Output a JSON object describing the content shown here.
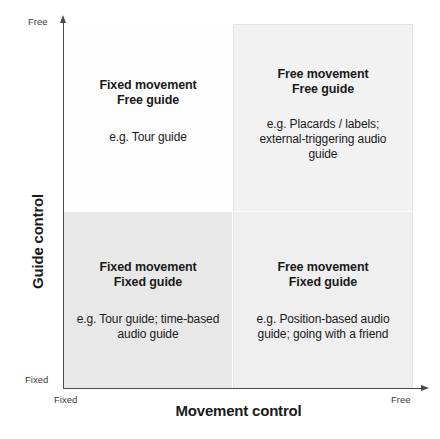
{
  "chart_data": {
    "type": "table",
    "title": "",
    "xlabel": "Movement control",
    "ylabel": "Guide control",
    "xticks": [
      "Fixed",
      "Free"
    ],
    "yticks": [
      "Fixed",
      "Free"
    ],
    "xlim": [
      "Fixed",
      "Free"
    ],
    "ylim": [
      "Fixed",
      "Free"
    ],
    "grid": false,
    "legend": "none",
    "categories": [
      "Fixed movement / Free guide",
      "Free movement / Free guide",
      "Fixed movement / Fixed guide",
      "Free movement / Fixed guide"
    ],
    "cells": [
      {
        "position": "top-left",
        "x": "Fixed",
        "y": "Free",
        "title": "Fixed movement\nFree guide",
        "example": "e.g. Tour guide",
        "fill": "#fdfdfd"
      },
      {
        "position": "top-right",
        "x": "Free",
        "y": "Free",
        "title": "Free movement\nFree guide",
        "example": "e.g. Placards / labels;\nexternal-triggering audio\nguide",
        "fill": "#f2f2f2"
      },
      {
        "position": "bottom-left",
        "x": "Fixed",
        "y": "Fixed",
        "title": "Fixed movement\nFixed guide",
        "example": "e.g. Tour guide; time-based\naudio guide",
        "fill": "#e8e8e8"
      },
      {
        "position": "bottom-right",
        "x": "Free",
        "y": "Fixed",
        "title": "Free movement\nFixed guide",
        "example": "e.g. Position-based audio\nguide; going with a friend",
        "fill": "#efefef"
      }
    ]
  },
  "axes": {
    "x_title": "Movement control",
    "y_title": "Guide control",
    "x_tick_low": "Fixed",
    "x_tick_high": "Free",
    "y_tick_low": "Fixed",
    "y_tick_high": "Free",
    "axis_color": "#4a4a4a"
  },
  "quadrants": {
    "top_left": {
      "title": "Fixed movement\nFree guide",
      "example": "e.g. Tour guide"
    },
    "top_right": {
      "title": "Free movement\nFree guide",
      "example": "e.g. Placards / labels;\nexternal-triggering audio\nguide"
    },
    "bottom_left": {
      "title": "Fixed movement\nFixed guide",
      "example": "e.g. Tour guide; time-based\naudio guide"
    },
    "bottom_right": {
      "title": "Free movement\nFixed guide",
      "example": "e.g. Position-based audio\nguide; going with a friend"
    }
  }
}
